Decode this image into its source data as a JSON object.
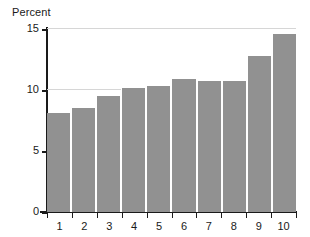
{
  "chart_data": {
    "type": "bar",
    "title": "Percent",
    "xlabel": "",
    "ylabel": "Percent",
    "categories": [
      "1",
      "2",
      "3",
      "4",
      "5",
      "6",
      "7",
      "8",
      "9",
      "10"
    ],
    "values": [
      8.1,
      8.5,
      9.5,
      10.2,
      10.3,
      10.9,
      10.7,
      10.7,
      12.8,
      14.6
    ],
    "ylim": [
      0,
      15
    ],
    "yticks": [
      0,
      5,
      10,
      15
    ],
    "ytick_labels": [
      "0",
      "5",
      "10",
      "15"
    ],
    "gridlines_at": [
      10,
      15
    ],
    "grid": true,
    "legend": null,
    "legend_position": "none",
    "bar_color": "#919191",
    "bar_separator_color": "#ffffff",
    "axis_color": "#1a1a1a",
    "gridline_color": "#d6d6d6",
    "background_color": "#ffffff"
  }
}
